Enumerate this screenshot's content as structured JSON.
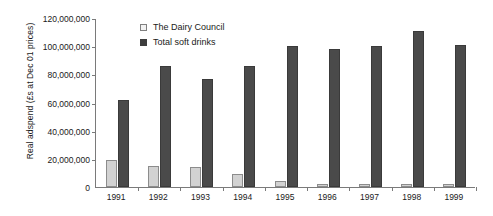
{
  "chart_data": {
    "type": "bar",
    "title": "",
    "xlabel": "",
    "ylabel": "Real adspend (£s at Dec 01 prices)",
    "categories": [
      "1991",
      "1992",
      "1993",
      "1994",
      "1995",
      "1996",
      "1997",
      "1998",
      "1999"
    ],
    "series": [
      {
        "name": "The Dairy Council",
        "color": "#d2d2d2",
        "values": [
          19000000,
          15000000,
          14000000,
          9000000,
          4000000,
          2000000,
          2000000,
          2000000,
          2000000
        ]
      },
      {
        "name": "Total soft drinks",
        "color": "#4a4a4a",
        "values": [
          62000000,
          86000000,
          77000000,
          86000000,
          100000000,
          98000000,
          100000000,
          111000000,
          101000000
        ]
      }
    ],
    "ylim": [
      0,
      120000000
    ],
    "y_ticks": [
      0,
      20000000,
      40000000,
      60000000,
      80000000,
      100000000,
      120000000
    ],
    "y_tick_labels": [
      "0",
      "20,000,000",
      "40,000,000",
      "60,000,000",
      "80,000,000",
      "100,000,000",
      "120,000,000"
    ],
    "grid": false,
    "legend_position": "top-left-inside",
    "legend": [
      {
        "label": "The Dairy Council",
        "swatch": "light-square-swatch"
      },
      {
        "label": "Total soft drinks",
        "swatch": "dark-square-swatch"
      }
    ]
  }
}
